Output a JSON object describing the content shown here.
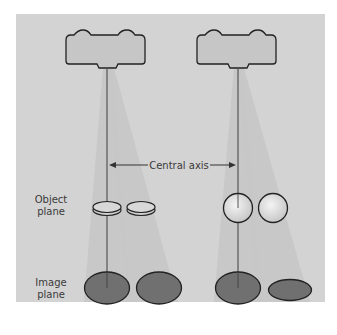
{
  "labels": {
    "central_axis": "Central axis",
    "object_plane_line1": "Object",
    "object_plane_line2": "plane",
    "image_plane_line1": "Image",
    "image_plane_line2": "plane"
  },
  "colors": {
    "background": "#d3d3d3",
    "beam": "#c4c4c4",
    "tube_fill": "#c6c6c6",
    "outline": "#222222",
    "image_fill": "#707070",
    "text": "#3a3a3a"
  },
  "panels": [
    {
      "name": "left",
      "object_shape": "disc",
      "objects": 2,
      "images": 2
    },
    {
      "name": "right",
      "object_shape": "sphere",
      "objects": 2,
      "images": 2
    }
  ]
}
